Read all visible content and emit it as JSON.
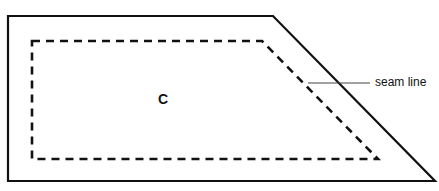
{
  "diagram": {
    "piece_label": "C",
    "annotations": [
      {
        "text": "seam line",
        "points_to": "dashed seam line"
      }
    ],
    "outline": {
      "style": "solid",
      "points": [
        [
          8,
          16
        ],
        [
          273,
          16
        ],
        [
          435,
          181
        ],
        [
          8,
          181
        ]
      ]
    },
    "seam": {
      "style": "dashed",
      "points": [
        [
          32,
          41
        ],
        [
          262,
          41
        ],
        [
          378,
          159
        ],
        [
          32,
          159
        ]
      ]
    },
    "leader_line": {
      "from": [
        308,
        83
      ],
      "to": [
        370,
        83
      ]
    },
    "colors": {
      "stroke": "#111111",
      "background": "#ffffff",
      "leader": "#444444"
    }
  }
}
